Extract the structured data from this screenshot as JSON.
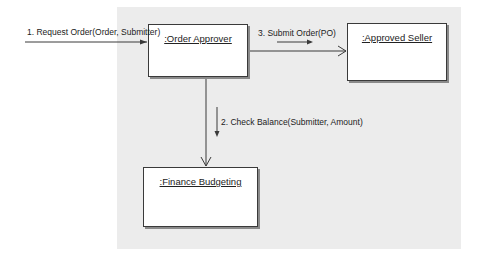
{
  "diagram": {
    "type": "UML collaboration diagram",
    "objects": [
      {
        "id": "order_approver",
        "label": ":Order Approver"
      },
      {
        "id": "approved_seller",
        "label": ":Approved Seller"
      },
      {
        "id": "finance_budgeting",
        "label": ":Finance Budgeting"
      }
    ],
    "messages": [
      {
        "seq": 1,
        "label": "1. Request Order(Order, Submitter)",
        "from": "actor",
        "to": "order_approver"
      },
      {
        "seq": 2,
        "label": "2. Check Balance(Submitter, Amount)",
        "from": "order_approver",
        "to": "finance_budgeting"
      },
      {
        "seq": 3,
        "label": "3. Submit Order(PO)",
        "from": "order_approver",
        "to": "approved_seller"
      }
    ]
  },
  "colors": {
    "background": "#ffffff",
    "canvas": "#ececec",
    "box_fill": "#ffffff",
    "line": "#3a3a3a"
  }
}
